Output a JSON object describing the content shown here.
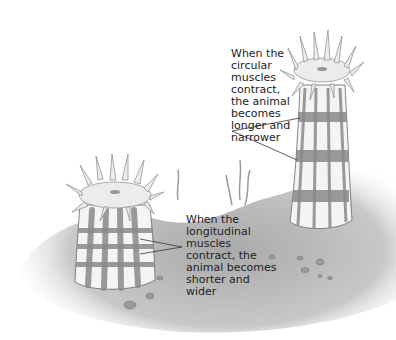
{
  "labels": {
    "circular": "When the\ncircular\nmuscles\ncontract,\nthe animal\nbecomes\nlonger and\nnarrower",
    "longitudinal": "When the\nlongitudinal\nmuscles\ncontract, the\nanimal becomes\nshorter and\nwider"
  },
  "colors": {
    "ground": "#b8b8b8",
    "body": "#f4f4f4",
    "band": "#8a8a8a",
    "tentacle": "#ececec",
    "line": "#333333"
  }
}
